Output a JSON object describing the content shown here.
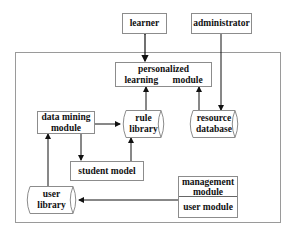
{
  "diagram": {
    "type": "system architecture block diagram",
    "nodes": {
      "learner": {
        "label": "learner",
        "shape": "rectangle"
      },
      "administrator": {
        "label": "administrator",
        "shape": "rectangle"
      },
      "personalized_learning_module": {
        "label": "personalized learning module",
        "shape": "rectangle"
      },
      "data_mining_module": {
        "label_line1": "data mining",
        "label_line2": "module",
        "shape": "rectangle"
      },
      "rule_library": {
        "label_line1": "rule",
        "label_line2": "library",
        "shape": "cylinder"
      },
      "resource_database": {
        "label_line1": "resource",
        "label_line2": "database",
        "shape": "cylinder"
      },
      "student_model": {
        "label": "student model",
        "shape": "rectangle"
      },
      "user_library": {
        "label_line1": "user",
        "label_line2": "library",
        "shape": "cylinder"
      },
      "management_module": {
        "label_line1": "management",
        "label_line2": "module",
        "shape": "rectangle"
      },
      "user_module": {
        "label": "user module",
        "shape": "rectangle"
      }
    },
    "edges": [
      {
        "from": "learner",
        "to": "personalized_learning_module",
        "direction": "bidirectional"
      },
      {
        "from": "administrator",
        "to": "resource_database",
        "direction": "forward"
      },
      {
        "from": "rule_library",
        "to": "personalized_learning_module",
        "direction": "forward"
      },
      {
        "from": "resource_database",
        "to": "personalized_learning_module",
        "direction": "forward"
      },
      {
        "from": "data_mining_module",
        "to": "rule_library",
        "direction": "forward"
      },
      {
        "from": "data_mining_module",
        "to": "student_model",
        "direction": "forward"
      },
      {
        "from": "student_model",
        "to": "rule_library",
        "direction": "forward"
      },
      {
        "from": "user_library",
        "to": "data_mining_module",
        "direction": "forward"
      },
      {
        "from": "user_module",
        "to": "user_library",
        "direction": "forward"
      }
    ],
    "colors": {
      "stroke": "#8c8c8c",
      "arrow": "#111111",
      "text": "#111111",
      "frame": "#9a9a9a"
    }
  }
}
